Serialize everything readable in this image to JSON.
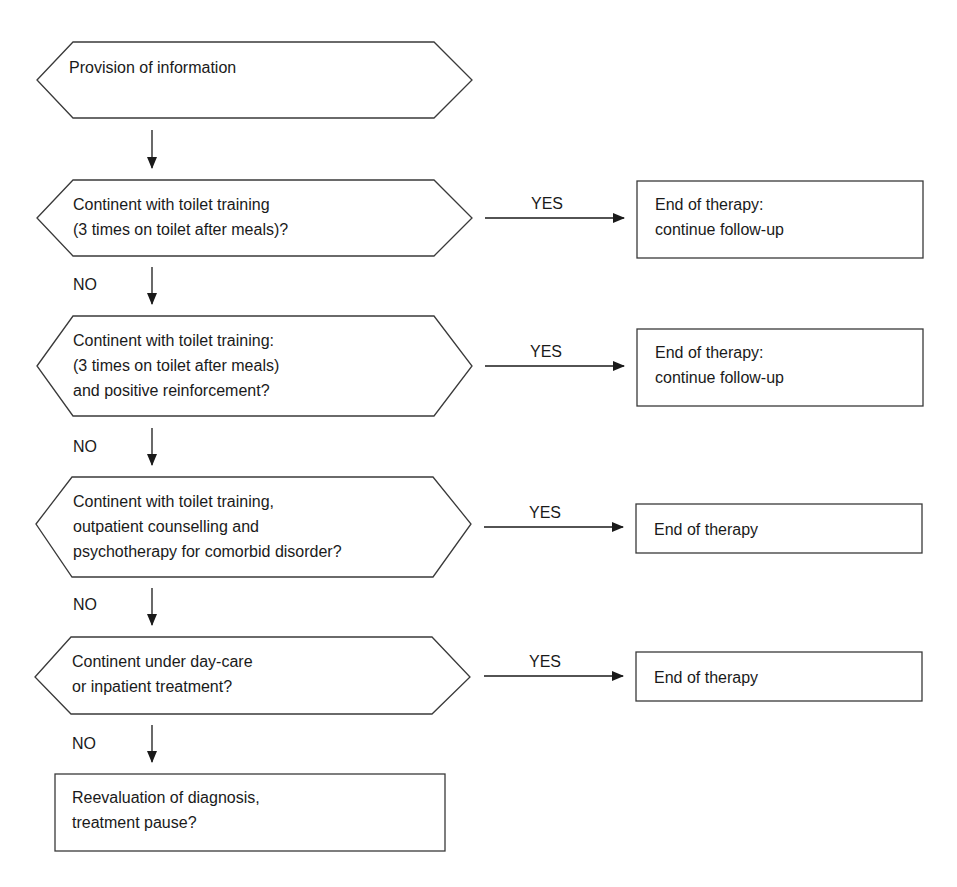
{
  "flowchart": {
    "start": {
      "text": "Provision of information"
    },
    "steps": [
      {
        "question": [
          "Continent with toilet training",
          "(3 times on toilet after meals)?"
        ],
        "yes_label": "YES",
        "outcome": [
          "End of therapy:",
          "continue follow-up"
        ],
        "no_label": "NO"
      },
      {
        "question": [
          "Continent with toilet training:",
          "(3 times on toilet after meals)",
          "and positive reinforcement?"
        ],
        "yes_label": "YES",
        "outcome": [
          "End of therapy:",
          "continue follow-up"
        ],
        "no_label": "NO"
      },
      {
        "question": [
          "Continent with toilet training,",
          "outpatient counselling and",
          "psychotherapy for comorbid disorder?"
        ],
        "yes_label": "YES",
        "outcome": [
          "End of therapy"
        ],
        "no_label": "NO"
      },
      {
        "question": [
          "Continent under day-care",
          "or inpatient treatment?"
        ],
        "yes_label": "YES",
        "outcome": [
          "End of therapy"
        ],
        "no_label": "NO"
      }
    ],
    "final": {
      "text": [
        "Reevaluation of diagnosis,",
        "treatment pause?"
      ]
    }
  },
  "colors": {
    "stroke": "#3a3a3a",
    "text": "#1a1a1a",
    "background": "#ffffff"
  }
}
